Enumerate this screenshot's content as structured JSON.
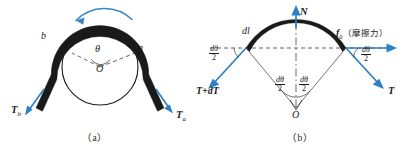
{
  "figure": {
    "caption_a": "（a）",
    "caption_b": "（b）"
  },
  "colors": {
    "belt": "#1a1a1a",
    "arrow_blue": "#2b7fc4",
    "rotation_arrow": "#3a86c8",
    "dashed": "#3a3a3a",
    "text": "#1d1d1d",
    "background": "#ffffff"
  },
  "panel_a": {
    "name": "belt-over-pulley",
    "labels": {
      "point_b": "b",
      "point_a": "a",
      "angle": "θ",
      "center": "O",
      "tension_left": "T",
      "tension_left_sub": "b",
      "tension_right": "T",
      "tension_right_sub": "a"
    },
    "icons": {
      "rotation_arrow": "curved-arrow-counterclockwise",
      "tension_left_arrow": "arrow-down-left",
      "tension_right_arrow": "arrow-down-right",
      "radius_line_left": "dashed-line",
      "radius_line_right": "dashed-line"
    }
  },
  "panel_b": {
    "name": "belt-element-free-body",
    "labels": {
      "arc_length": "dl",
      "normal_force": "N",
      "friction_force": "f",
      "friction_sub": "0",
      "friction_note": "（摩擦力）",
      "tension_left": "T+dT",
      "tension_right": "T",
      "half_angle_left": "dθ",
      "half_angle_left_den": "2",
      "half_angle_right": "dθ",
      "half_angle_right_den": "2",
      "center_angle_left_num": "dθ",
      "center_angle_left_den": "2",
      "center_angle_right_num": "dθ",
      "center_angle_right_den": "2",
      "center": "O"
    },
    "icons": {
      "normal_arrow": "arrow-up",
      "friction_arrow": "arrow-right",
      "tension_left_arrow": "arrow-down-left",
      "tension_right_arrow": "arrow-down-right",
      "horizontal_dashed": "dashed-line",
      "vertical_center_line": "dash-dot-line",
      "radius_left": "thin-line",
      "radius_right": "thin-line",
      "angle_marker_left": "angle-arc",
      "angle_marker_right": "angle-arc"
    }
  }
}
